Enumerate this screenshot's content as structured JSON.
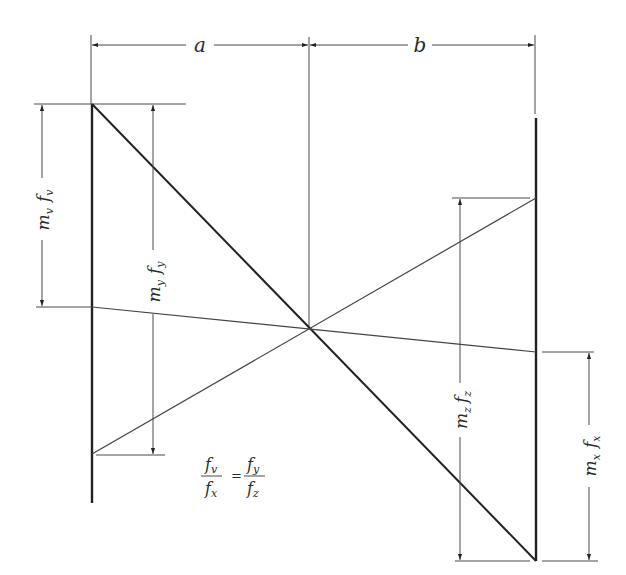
{
  "diagram": {
    "type": "nomogram-geometry",
    "background": "#ffffff",
    "line_color": "#222222",
    "dimensions": {
      "a": {
        "label": "a"
      },
      "b": {
        "label": "b"
      }
    },
    "scale_labels": {
      "left_outer": {
        "m": "m",
        "m_sub": "v",
        "f": "f",
        "f_sub": "v"
      },
      "left_inner": {
        "m": "m",
        "m_sub": "y",
        "f": "f",
        "f_sub": "y"
      },
      "right_inner": {
        "m": "m",
        "m_sub": "z",
        "f": "f",
        "f_sub": "z"
      },
      "right_outer": {
        "m": "m",
        "m_sub": "x",
        "f": "f",
        "f_sub": "x"
      }
    },
    "equation": {
      "left_num": "f",
      "left_num_sub": "v",
      "left_den": "f",
      "left_den_sub": "x",
      "equals": "=",
      "right_num": "f",
      "right_num_sub": "y",
      "right_den": "f",
      "right_den_sub": "z"
    }
  }
}
